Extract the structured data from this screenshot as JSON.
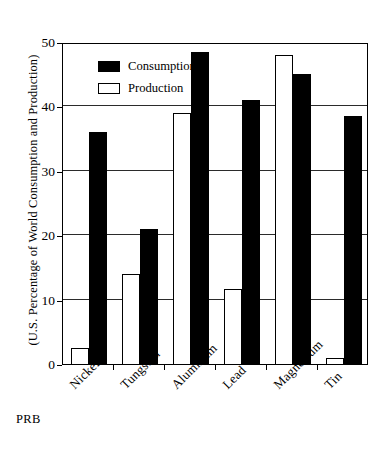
{
  "chart_data": {
    "type": "bar",
    "title": "",
    "subtitle": "",
    "xlabel": "",
    "ylabel": "(U.S. Percentage of World Consumption and Production)",
    "ylim": [
      0,
      50
    ],
    "yticks": [
      0,
      10,
      20,
      30,
      40,
      50
    ],
    "ytick_labels": [
      "0",
      "10",
      "20",
      "30",
      "40",
      "50"
    ],
    "grid": true,
    "grid_axis": "y",
    "legend_position": "upper-left-inside",
    "categories": [
      "Nickel",
      "Tungsten",
      "Aluminum",
      "Lead",
      "Magnesium",
      "Tin"
    ],
    "series": [
      {
        "name": "Production",
        "color": "#ffffff",
        "edge_color": "#000000",
        "values": [
          2.5,
          14.0,
          39.0,
          11.7,
          48.0,
          1.0
        ]
      },
      {
        "name": "Consumption",
        "color": "#000000",
        "edge_color": "#000000",
        "values": [
          36.0,
          21.0,
          48.5,
          41.0,
          45.0,
          38.5
        ]
      }
    ],
    "annotations": [
      {
        "text": "PRB",
        "position": "bottom-left"
      }
    ]
  },
  "legend": {
    "items": [
      {
        "label": "Consumption",
        "swatch": "filled-black-swatch"
      },
      {
        "label": "Production",
        "swatch": "hollow-white-swatch"
      }
    ]
  },
  "credit": {
    "text": "PRB"
  }
}
